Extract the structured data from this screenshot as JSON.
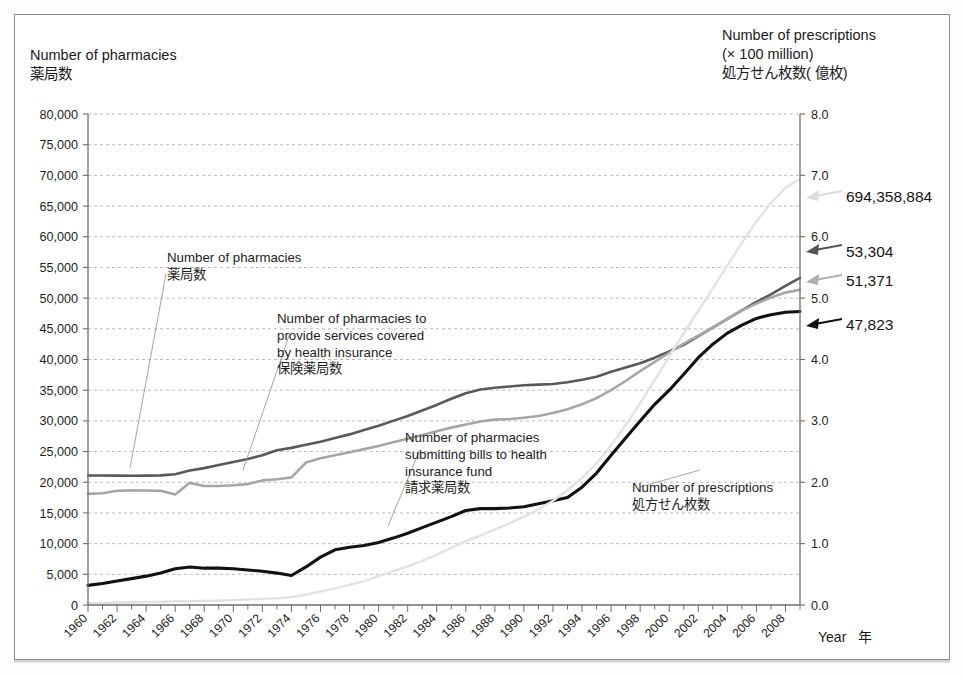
{
  "figure": {
    "axis_title_left": "Number of pharmacies\n薬局数",
    "axis_title_right": "Number of prescriptions\n(× 100 million)\n処方せん枚数( 億枚)",
    "xaxis_title": "Year   年"
  },
  "annotations": {
    "callout_pharmacies": "Number of pharmacies\n薬局数",
    "callout_insured": "Number of pharmacies to\nprovide services covered\nby health insurance\n保険薬局数",
    "callout_billing": "Number of pharmacies\nsubmitting bills to health\ninsurance fund\n請求薬局数",
    "callout_prescriptions": "Number of prescriptions\n処方せん枚数",
    "value_prescriptions": "694,358,884",
    "value_pharmacies": "53,304",
    "value_insured": "51,371",
    "value_billing": "47,823"
  },
  "colors": {
    "pharmacies": "#595959",
    "insured": "#a6a6a6",
    "billing": "#111111",
    "prescriptions": "#e2e2e2",
    "grid": "#9a9a9a",
    "axis": "#6d6d6d",
    "frame": "#8d8d8d"
  },
  "chart_data": {
    "type": "line",
    "title": "",
    "xlabel": "Year   年",
    "ylabel": "Number of pharmacies",
    "y2label": "Number of prescriptions (× 100 million)",
    "grid": true,
    "legend": "annotations-inline",
    "xlim": [
      1960,
      2009
    ],
    "ylim": [
      0,
      80000
    ],
    "y2lim": [
      0,
      8.0
    ],
    "yticks": [
      0,
      5000,
      10000,
      15000,
      20000,
      25000,
      30000,
      35000,
      40000,
      45000,
      50000,
      55000,
      60000,
      65000,
      70000,
      75000,
      80000
    ],
    "ytick_labels": [
      "0",
      "5,000",
      "10,000",
      "15,000",
      "20,000",
      "25,000",
      "30,000",
      "35,000",
      "40,000",
      "45,000",
      "50,000",
      "55,000",
      "60,000",
      "65,000",
      "70,000",
      "75,000",
      "80,000"
    ],
    "y2ticks": [
      0.0,
      1.0,
      2.0,
      3.0,
      4.0,
      5.0,
      6.0,
      7.0,
      8.0
    ],
    "y2tick_labels": [
      "0.0",
      "1.0",
      "2.0",
      "3.0",
      "4.0",
      "5.0",
      "6.0",
      "7.0",
      "8.0"
    ],
    "xticks": [
      1960,
      1962,
      1964,
      1966,
      1968,
      1970,
      1972,
      1974,
      1976,
      1978,
      1980,
      1982,
      1984,
      1986,
      1988,
      1990,
      1992,
      1994,
      1996,
      1998,
      2000,
      2002,
      2004,
      2006,
      2008
    ],
    "xtick_labels": [
      "1960",
      "1962",
      "1964",
      "1966",
      "1968",
      "1970",
      "1972",
      "1974",
      "1976",
      "1978",
      "1980",
      "1982",
      "1984",
      "1986",
      "1988",
      "1990",
      "1992",
      "1994",
      "1996",
      "1998",
      "2000",
      "2002",
      "2004",
      "2006",
      "2008"
    ],
    "x": [
      1960,
      1961,
      1962,
      1963,
      1964,
      1965,
      1966,
      1967,
      1968,
      1969,
      1970,
      1971,
      1972,
      1973,
      1974,
      1975,
      1976,
      1977,
      1978,
      1979,
      1980,
      1981,
      1982,
      1983,
      1984,
      1985,
      1986,
      1987,
      1988,
      1989,
      1990,
      1991,
      1992,
      1993,
      1994,
      1995,
      1996,
      1997,
      1998,
      1999,
      2000,
      2001,
      2002,
      2003,
      2004,
      2005,
      2006,
      2007,
      2008,
      2009
    ],
    "series": [
      {
        "name": "Number of pharmacies",
        "name_ja": "薬局数",
        "axis": "left",
        "color": "#595959",
        "width": 2.6,
        "values": [
          21100,
          21100,
          21080,
          21060,
          21080,
          21120,
          21300,
          21900,
          22300,
          22800,
          23300,
          23800,
          24400,
          25200,
          25600,
          26100,
          26600,
          27200,
          27800,
          28500,
          29200,
          30000,
          30800,
          31700,
          32600,
          33600,
          34500,
          35100,
          35400,
          35600,
          35800,
          35900,
          36000,
          36300,
          36700,
          37200,
          38000,
          38700,
          39400,
          40300,
          41300,
          42400,
          43800,
          45200,
          46600,
          48000,
          49400,
          50600,
          52000,
          53304
        ]
      },
      {
        "name": "Number of pharmacies to provide services covered by health insurance",
        "name_ja": "保険薬局数",
        "axis": "left",
        "color": "#a6a6a6",
        "width": 2.6,
        "values": [
          18100,
          18200,
          18600,
          18700,
          18650,
          18600,
          18000,
          19900,
          19400,
          19400,
          19500,
          19700,
          20300,
          20500,
          20800,
          23200,
          23900,
          24400,
          24900,
          25400,
          25900,
          26500,
          27100,
          27700,
          28300,
          28900,
          29400,
          29900,
          30200,
          30300,
          30500,
          30800,
          31300,
          31900,
          32700,
          33700,
          35000,
          36500,
          38100,
          39600,
          41100,
          42600,
          43900,
          45200,
          46600,
          48000,
          49100,
          50100,
          50900,
          51371
        ]
      },
      {
        "name": "Number of pharmacies submitting bills to health insurance fund",
        "name_ja": "請求薬局数",
        "axis": "left",
        "color": "#111111",
        "width": 3.1,
        "values": [
          3200,
          3500,
          3900,
          4300,
          4700,
          5200,
          5900,
          6200,
          6000,
          6000,
          5900,
          5700,
          5500,
          5200,
          4800,
          6200,
          7800,
          9000,
          9400,
          9700,
          10200,
          10900,
          11700,
          12600,
          13500,
          14400,
          15400,
          15700,
          15700,
          15800,
          16000,
          16500,
          17000,
          17500,
          19200,
          21500,
          24400,
          27200,
          30000,
          32700,
          35000,
          37600,
          40300,
          42500,
          44300,
          45600,
          46700,
          47300,
          47700,
          47823
        ]
      },
      {
        "name": "Number of prescriptions",
        "name_ja": "処方せん枚数",
        "axis": "right",
        "color": "#e2e2e2",
        "width": 2.4,
        "values": [
          0.03,
          0.03,
          0.04,
          0.04,
          0.05,
          0.05,
          0.06,
          0.06,
          0.07,
          0.07,
          0.08,
          0.09,
          0.1,
          0.11,
          0.13,
          0.17,
          0.22,
          0.27,
          0.33,
          0.39,
          0.47,
          0.55,
          0.63,
          0.72,
          0.82,
          0.93,
          1.04,
          1.13,
          1.23,
          1.33,
          1.44,
          1.56,
          1.7,
          1.87,
          2.07,
          2.31,
          2.6,
          2.93,
          3.29,
          3.66,
          4.05,
          4.43,
          4.79,
          5.16,
          5.53,
          5.9,
          6.25,
          6.55,
          6.8,
          6.94
        ]
      }
    ],
    "endpoint_labels": [
      {
        "series": "Number of prescriptions",
        "value_text": "694,358,884"
      },
      {
        "series": "Number of pharmacies",
        "value_text": "53,304"
      },
      {
        "series": "Number of pharmacies to provide services covered by health insurance",
        "value_text": "51,371"
      },
      {
        "series": "Number of pharmacies submitting bills to health insurance fund",
        "value_text": "47,823"
      }
    ]
  }
}
